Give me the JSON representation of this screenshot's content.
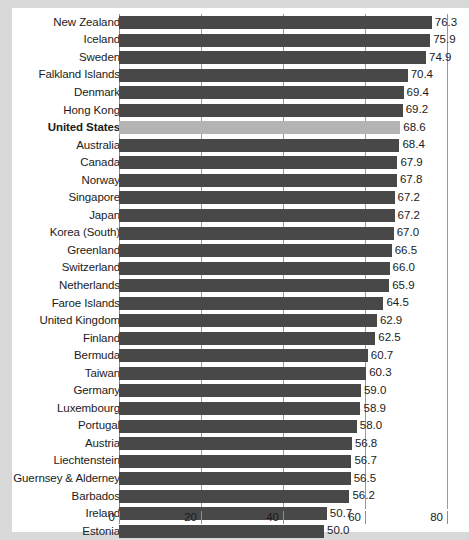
{
  "chart_data": {
    "type": "bar",
    "orientation": "horizontal",
    "title": "",
    "subtitle": "",
    "xlabel": "",
    "ylabel": "",
    "xlim": [
      0,
      80
    ],
    "xticks": [
      "0",
      "20",
      "40",
      "60",
      "80"
    ],
    "xtick_values": [
      0,
      20,
      40,
      60,
      80
    ],
    "grid": true,
    "legend": "none",
    "highlight_category": "United States",
    "colors": {
      "bar": "#484848",
      "highlight_bar": "#b4b4b4",
      "background": "#d9d9d9",
      "panel": "#ffffff",
      "gridline": "#9a9a9a",
      "text": "#1b1b1b"
    },
    "categories": [
      "New Zealand",
      "Iceland",
      "Sweden",
      "Falkland Islands",
      "Denmark",
      "Hong Kong",
      "United States",
      "Australia",
      "Canada",
      "Norway",
      "Singapore",
      "Japan",
      "Korea (South)",
      "Greenland",
      "Switzerland",
      "Netherlands",
      "Faroe Islands",
      "United Kingdom",
      "Finland",
      "Bermuda",
      "Taiwan",
      "Germany",
      "Luxembourg",
      "Portugal",
      "Austria",
      "Liechtenstein",
      "Guernsey & Alderney",
      "Barbados",
      "Ireland",
      "Estonia"
    ],
    "values": [
      76.3,
      75.9,
      74.9,
      70.4,
      69.4,
      69.2,
      68.6,
      68.4,
      67.9,
      67.8,
      67.2,
      67.2,
      67.0,
      66.5,
      66.0,
      65.9,
      64.5,
      62.9,
      62.5,
      60.7,
      60.3,
      59.0,
      58.9,
      58.0,
      56.8,
      56.7,
      56.5,
      56.2,
      50.7,
      50.0
    ],
    "value_labels": [
      "76.3",
      "75.9",
      "74.9",
      "70.4",
      "69.4",
      "69.2",
      "68.6",
      "68.4",
      "67.9",
      "67.8",
      "67.2",
      "67.2",
      "67.0",
      "66.5",
      "66.0",
      "65.9",
      "64.5",
      "62.9",
      "62.5",
      "60.7",
      "60.3",
      "59.0",
      "58.9",
      "58.0",
      "56.8",
      "56.7",
      "56.5",
      "56.2",
      "50.7",
      "50.0"
    ]
  }
}
